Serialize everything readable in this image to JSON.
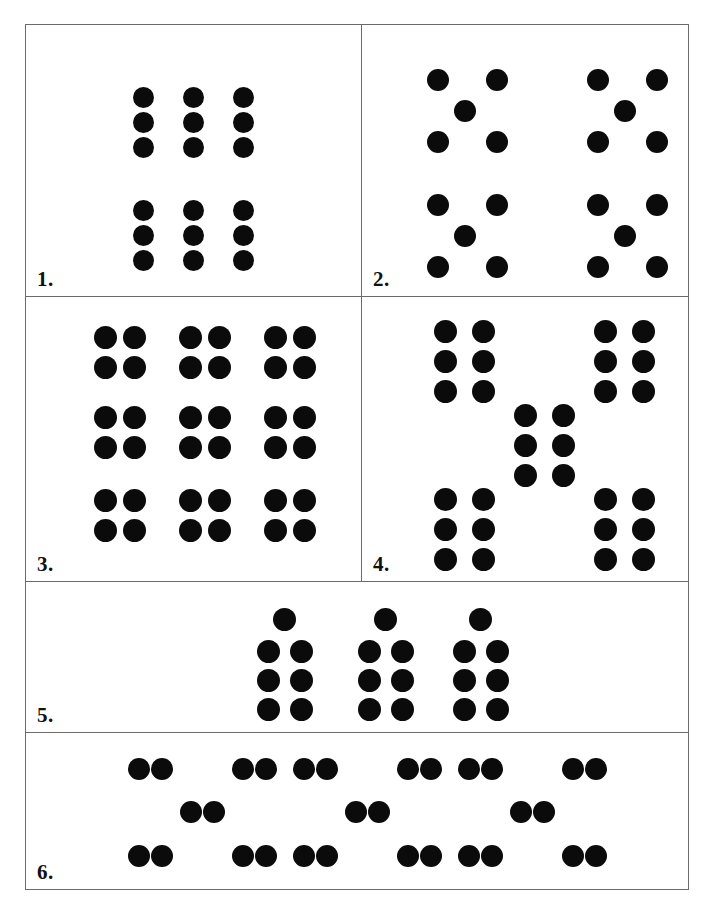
{
  "worksheet": {
    "title": "Dot pattern grouping worksheet",
    "border_color": "#6b6b6b",
    "dot_color": "#0b0b0b",
    "background": "#ffffff"
  },
  "panels": [
    {
      "number": "1.",
      "label": "1.",
      "description": "Two stacked blocks of nine dots arranged three by three",
      "total_dots": 18,
      "groups": 2,
      "dots_per_group": 9,
      "group_shape": "3 columns x 3 rows",
      "arrangement": "two groups stacked vertically"
    },
    {
      "number": "2.",
      "label": "2.",
      "description": "Four five-dot dice patterns arranged two by two",
      "total_dots": 20,
      "groups": 4,
      "dots_per_group": 5,
      "group_shape": "four corners plus one centre dot",
      "arrangement": "two by two grid of groups"
    },
    {
      "number": "3.",
      "label": "3.",
      "description": "Nine blocks of four dots arranged three by three",
      "total_dots": 36,
      "groups": 9,
      "dots_per_group": 4,
      "group_shape": "2 columns x 2 rows",
      "arrangement": "three by three grid of groups"
    },
    {
      "number": "4.",
      "label": "4.",
      "description": "Five blocks of six dots placed in a dice-five layout",
      "total_dots": 30,
      "groups": 5,
      "dots_per_group": 6,
      "group_shape": "2 columns x 3 rows",
      "arrangement": "four corner groups plus one centre group"
    },
    {
      "number": "5.",
      "label": "5.",
      "description": "Three blocks of seven dots, each a two-by-three block topped by one dot",
      "total_dots": 21,
      "groups": 3,
      "dots_per_group": 7,
      "group_shape": "2 columns x 3 rows plus one dot above centre",
      "arrangement": "three groups in a row"
    },
    {
      "number": "6.",
      "label": "6.",
      "description": "Three blocks of ten dots, each five pairs in a dice-five layout",
      "total_dots": 30,
      "groups": 3,
      "dots_per_group": 10,
      "group_shape": "five pairs of dots",
      "arrangement": "three groups in a row"
    }
  ]
}
